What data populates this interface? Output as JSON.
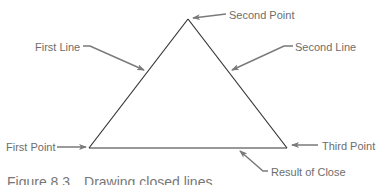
{
  "figure": {
    "caption_label": "Figure 8.3",
    "caption_text": "Drawing closed lines",
    "labels": {
      "first_line": "First Line",
      "second_point": "Second Point",
      "second_line": "Second Line",
      "first_point": "First Point",
      "third_point": "Third Point",
      "result_of_close": "Result of Close"
    },
    "colors": {
      "line": "#333333",
      "arrow": "#7a7a7a",
      "text": "#6d6d6d"
    }
  }
}
